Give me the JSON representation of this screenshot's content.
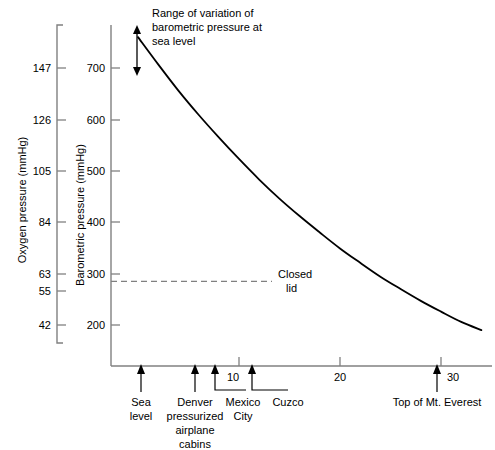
{
  "chart_data": {
    "type": "line",
    "title": "",
    "xlabel": "",
    "ylabel": "Barometric pressure (mmHg)",
    "y2label": "Oxygen pressure (mmHg)",
    "grid": false,
    "legend": "none",
    "xlim": [
      0,
      34
    ],
    "ylim": [
      150,
      790
    ],
    "x_unit": "thousands of feet altitude",
    "x_ticks": [
      10,
      20,
      30
    ],
    "x_tick_labels": [
      "10",
      "20",
      "30"
    ],
    "barometric_ticks": [
      700,
      600,
      500,
      400,
      300,
      200
    ],
    "barometric_tick_labels": [
      "700",
      "600",
      "500",
      "400",
      "300",
      "200"
    ],
    "oxygen_ticks": [
      147,
      126,
      105,
      84,
      63,
      55,
      42
    ],
    "oxygen_tick_labels": [
      "147",
      "126",
      "105",
      "84",
      "63",
      "55",
      "42"
    ],
    "series": [
      {
        "name": "Barometric pressure",
        "x": [
          0,
          2,
          4,
          6,
          8,
          10,
          12,
          14,
          16,
          18,
          20,
          22,
          24,
          26,
          28,
          30,
          32,
          34
        ],
        "values": [
          760,
          707,
          656,
          609,
          565,
          523,
          483,
          446,
          412,
          380,
          349,
          321,
          294,
          270,
          247,
          226,
          206,
          190
        ]
      }
    ],
    "reference_lines": [
      {
        "name": "closed-lid",
        "orientation": "horizontal",
        "value": 55,
        "value_axis": "oxygen",
        "barometric_value": 285,
        "style": "dashed",
        "label": "Closed",
        "label_line2": "lid"
      }
    ],
    "annotations": [
      {
        "name": "range-of-variation",
        "text_line1": "Range of variation of",
        "text_line2": "barometric pressure at",
        "text_line3": "sea level",
        "arrow": "double-headed-vertical"
      }
    ],
    "x_markers": [
      {
        "name": "sea-level",
        "x": 0,
        "label_line1": "Sea",
        "label_line2": "level",
        "label_line3": "",
        "label_line4": ""
      },
      {
        "name": "denver",
        "x": 5.3,
        "label_line1": "Denver",
        "label_line2": "pressurized",
        "label_line3": "airplane",
        "label_line4": "cabins"
      },
      {
        "name": "mexico-city",
        "x": 7.3,
        "label_line1": "Mexico",
        "label_line2": "City",
        "label_line3": "",
        "label_line4": ""
      },
      {
        "name": "cuzco",
        "x": 11.1,
        "label_line1": "Cuzco",
        "label_line2": "",
        "label_line3": "",
        "label_line4": ""
      },
      {
        "name": "mt-everest",
        "x": 29.2,
        "label_line1": "Top of Mt. Everest",
        "label_line2": "",
        "label_line3": "",
        "label_line4": ""
      }
    ],
    "colors": {
      "curve": "#000000",
      "axis": "#808080",
      "reference_line": "#808080",
      "text": "#000000",
      "background": "#ffffff"
    }
  }
}
